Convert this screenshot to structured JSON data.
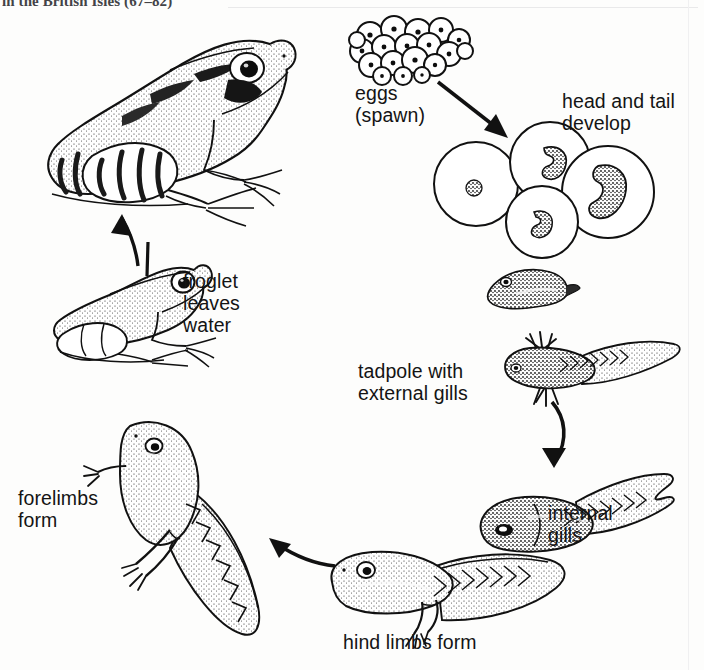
{
  "page": {
    "background_color": "#fdfdfc",
    "ink_color": "#141414",
    "width": 704,
    "height": 670,
    "cut_off_running_caption": "in the British Isles (67–82)"
  },
  "diagram": {
    "type": "life-cycle",
    "direction": "clockwise from eggs at top, back to adult frog at upper left",
    "stages": [
      {
        "id": "eggs",
        "label": "eggs\n(spawn)",
        "order": 1
      },
      {
        "id": "head-tail",
        "label": "head and tail\ndevelop",
        "order": 2
      },
      {
        "id": "hatchling",
        "label": "",
        "order": 3
      },
      {
        "id": "external-gills",
        "label": "tadpole with\nexternal gills",
        "order": 4
      },
      {
        "id": "internal-gills",
        "label": "internal\ngills",
        "order": 5
      },
      {
        "id": "hind-limbs",
        "label": "hind limbs form",
        "order": 6
      },
      {
        "id": "forelimbs",
        "label": "forelimbs\nform",
        "order": 7
      },
      {
        "id": "froglet",
        "label": "froglet\nleaves\nwater",
        "order": 8
      },
      {
        "id": "adult-frog",
        "label": "",
        "order": 9
      }
    ],
    "arrows": [
      {
        "from": "eggs",
        "to": "head-tail",
        "shape": "straight-diagonal",
        "points_to": "down-right"
      },
      {
        "from": "external-gills",
        "to": "internal-gills",
        "shape": "curved",
        "points_to": "down"
      },
      {
        "from": "hind-limbs",
        "to": "forelimbs",
        "shape": "curved",
        "points_to": "left"
      },
      {
        "from": "froglet",
        "to": "adult-frog",
        "shape": "curved",
        "points_to": "up"
      }
    ],
    "egg_cluster": {
      "egg_count": 19,
      "style": "circles with dark central yolk dot"
    }
  }
}
